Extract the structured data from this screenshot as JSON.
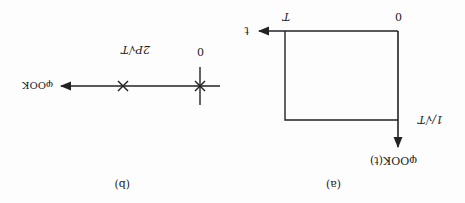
{
  "orientation": "rotated 180 degrees",
  "colors": {
    "ink": "#222222",
    "background": "#fdfdfd"
  },
  "panel_a": {
    "caption": "(a)",
    "y_axis_label": "φOOK(t)",
    "x_axis_label": "t",
    "origin_label": "0",
    "x_tick_label": "T",
    "y_tick_label": "1/√T",
    "shape": "rectangular pulse of height 1/√T from 0 to T"
  },
  "panel_b": {
    "caption": "(b)",
    "axis_label": "φOOK",
    "points": [
      {
        "label": "0",
        "marker": "star"
      },
      {
        "label": "2P√T",
        "marker": "cross"
      }
    ]
  }
}
